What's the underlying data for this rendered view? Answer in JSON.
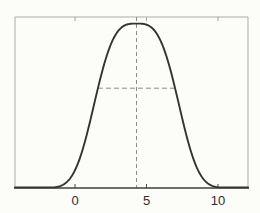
{
  "figure": {
    "background": "#fcfcf9",
    "frame_color": "#ababab",
    "axis_color": "#3f3f3f",
    "curve_color": "#333333",
    "dash_color": "#8c8c8c",
    "tick_color": "#4a4a4a",
    "top_tick_color": "#a0a0a0",
    "label_color": "#2f2f2f"
  },
  "chart_data": {
    "type": "line",
    "subtype": "bell-curve",
    "title": "",
    "xlabel": "",
    "ylabel": "",
    "grid": false,
    "legend": false,
    "x_ticks": [
      0,
      5,
      10
    ],
    "x_tick_labels": [
      "0",
      "5",
      "10"
    ],
    "xlim": [
      -4.2,
      12.1
    ],
    "ylim": [
      0,
      1.04
    ],
    "curve": {
      "shape": "bell",
      "mean": 4.3,
      "half_width_at_inflection": 2.7,
      "exponent": 3.2,
      "peak": 1.0
    },
    "annotations": [
      {
        "kind": "vline",
        "style": "dashed",
        "x": 4.3,
        "extends": "axis-to-top-frame"
      },
      {
        "kind": "hline-segment",
        "style": "dashed",
        "y_frac_of_peak": 0.607,
        "x_from": 1.6,
        "x_to": 7.0
      }
    ]
  }
}
